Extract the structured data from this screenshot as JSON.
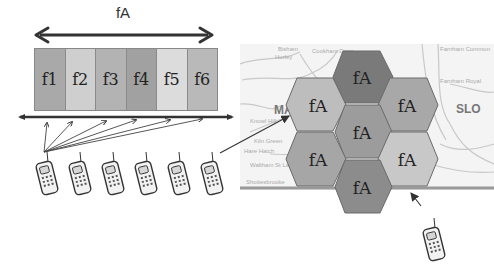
{
  "frequency_band": {
    "label": "fA",
    "channels": [
      {
        "label": "f1",
        "color": "#a9a9a9"
      },
      {
        "label": "f2",
        "color": "#cfcfcf"
      },
      {
        "label": "f3",
        "color": "#b3b3b3"
      },
      {
        "label": "f4",
        "color": "#a1a1a1"
      },
      {
        "label": "f5",
        "color": "#dcdcdc"
      },
      {
        "label": "f6",
        "color": "#b9b9b9"
      }
    ]
  },
  "mobiles_left": {
    "count": 6,
    "icon": "mobile-phone-icon"
  },
  "cell_map": {
    "cells": [
      {
        "position": "top",
        "label": "fA",
        "color": "#7a7a7a"
      },
      {
        "position": "upper-left",
        "label": "fA",
        "color": "#bdbdbd"
      },
      {
        "position": "upper-right",
        "label": "fA",
        "color": "#a8a8a8"
      },
      {
        "position": "center",
        "label": "fA",
        "color": "#9c9c9c"
      },
      {
        "position": "lower-left",
        "label": "fA",
        "color": "#a6a6a6"
      },
      {
        "position": "lower-right",
        "label": "fA",
        "color": "#c8c8c8"
      },
      {
        "position": "bottom",
        "label": "fA",
        "color": "#8c8c8c"
      }
    ],
    "map_labels": [
      {
        "text": "Bisham",
        "x": 38,
        "y": 2
      },
      {
        "text": "Hurley",
        "x": 35,
        "y": 10
      },
      {
        "text": "Cookham Dean",
        "x": 72,
        "y": 4
      },
      {
        "text": "Burnham Beeches",
        "x": 282,
        "y": 2
      },
      {
        "text": "Farnham Common",
        "x": 356,
        "y": 2
      },
      {
        "text": "Farnham Royal",
        "x": 360,
        "y": 34
      },
      {
        "text": "Waltham St Lawrence",
        "x": 10,
        "y": 118
      },
      {
        "text": "Knowl Hill",
        "x": 10,
        "y": 74
      },
      {
        "text": "Kiln Green",
        "x": 14,
        "y": 94
      },
      {
        "text": "Hare Hatch",
        "x": 4,
        "y": 104
      },
      {
        "text": "Shottesbrooke",
        "x": 6,
        "y": 135
      }
    ],
    "big_labels": [
      {
        "text": "MA",
        "x": 34,
        "y": 59
      },
      {
        "text": "SLO",
        "x": 216,
        "y": 58
      }
    ]
  },
  "mobile_right": {
    "icon": "mobile-phone-icon"
  }
}
